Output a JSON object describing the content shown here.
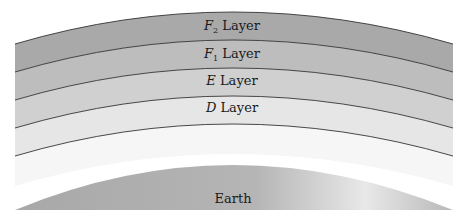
{
  "diagram": {
    "layers": [
      {
        "id": "f2",
        "letter": "F",
        "subscript": "2",
        "suffix": " Layer",
        "color": "#a9a9a9"
      },
      {
        "id": "f1",
        "letter": "F",
        "subscript": "1",
        "suffix": " Layer",
        "color": "#bdbdbd"
      },
      {
        "id": "e",
        "letter": "E",
        "subscript": "",
        "suffix": " Layer",
        "color": "#d0d0d0"
      },
      {
        "id": "d",
        "letter": "D",
        "subscript": "",
        "suffix": " Layer",
        "color": "#e4e4e4"
      }
    ],
    "earth": {
      "label": "Earth",
      "color": "#b0b0b0"
    },
    "line_color": "#333333"
  }
}
